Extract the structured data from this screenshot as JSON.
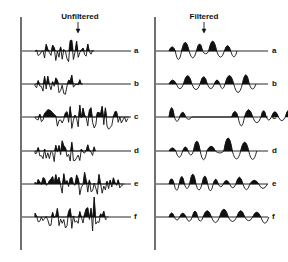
{
  "figure": {
    "panels": [
      {
        "id": "unfiltered",
        "title": "Unfiltered",
        "axis_x": 21,
        "line_end": 131,
        "title_x": 80,
        "arrow_x": 78,
        "label_x": 134
      },
      {
        "id": "filtered",
        "title": "Filtered",
        "axis_x": 155,
        "line_end": 268,
        "title_x": 204,
        "arrow_x": 204,
        "label_x": 272
      }
    ],
    "traces": [
      {
        "label": "a",
        "baseline_y": 51
      },
      {
        "label": "b",
        "baseline_y": 84
      },
      {
        "label": "c",
        "baseline_y": 117
      },
      {
        "label": "d",
        "baseline_y": 151
      },
      {
        "label": "e",
        "baseline_y": 184
      },
      {
        "label": "f",
        "baseline_y": 217
      }
    ],
    "axis_top": 17,
    "axis_bottom": 250,
    "colors": {
      "ink": "#111111",
      "background": "#ffffff"
    }
  }
}
